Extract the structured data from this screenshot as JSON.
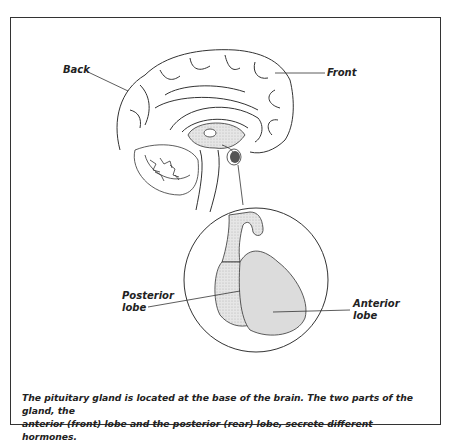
{
  "diagram": {
    "labels": {
      "back": "Back",
      "front": "Front",
      "posterior": [
        "Posterior",
        "lobe"
      ],
      "anterior": [
        "Anterior",
        "lobe"
      ]
    },
    "caption": {
      "line1": "The pituitary gland is located at the base of the brain. The two parts of the gland, the",
      "line2": "anterior (front) lobe and the posterior (rear) lobe, secrete different hormones."
    },
    "colors": {
      "stroke": "#333333",
      "shading": "#d9d9d9",
      "gland_dark": "#555555"
    }
  }
}
